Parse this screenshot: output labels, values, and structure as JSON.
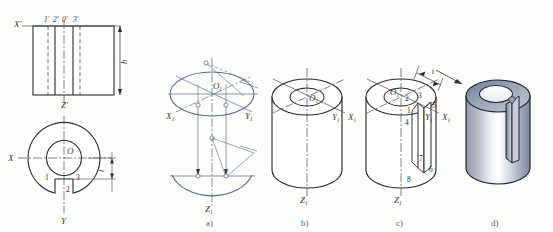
{
  "figure": {
    "background_color": "#fdfdfc",
    "line_color": "#2b2b2b",
    "construction_color": "#5a6a86",
    "metal_light": "#f2f4f7",
    "metal_mid": "#b9c0cc",
    "metal_dark": "#7e8characters"
  },
  "orthographic": {
    "front_view": {
      "axis_label": "X'",
      "bottom_axis_label": "Z'",
      "height_dim": "h",
      "point_labels": [
        "1'",
        "2'",
        "0'",
        "3'"
      ]
    },
    "bottom_view": {
      "axis_label_x": "X",
      "axis_label_y": "Y",
      "center_label": "O",
      "thickness_dim": "t",
      "point_labels": [
        "1",
        "2",
        "3"
      ]
    }
  },
  "steps": [
    {
      "caption": "a)",
      "center_label": "O1",
      "axes": [
        "X1",
        "Y1",
        "Z1"
      ],
      "description": "ellipse construction with projection lines"
    },
    {
      "caption": "b)",
      "center_label": "O1",
      "axes": [
        "X1",
        "Y1",
        "Z1"
      ],
      "description": "cylinder body with bore ellipse"
    },
    {
      "caption": "c)",
      "center_label": "O1",
      "axes": [
        "X1",
        "Y1",
        "Z1"
      ],
      "dimension": "t",
      "point_labels": [
        "1",
        "2",
        "3",
        "4",
        "5",
        "6",
        "7",
        "8"
      ],
      "description": "slot construction on cylinder"
    },
    {
      "caption": "d)",
      "description": "finished shaded solid"
    }
  ],
  "subscripts": {
    "one": "1"
  }
}
